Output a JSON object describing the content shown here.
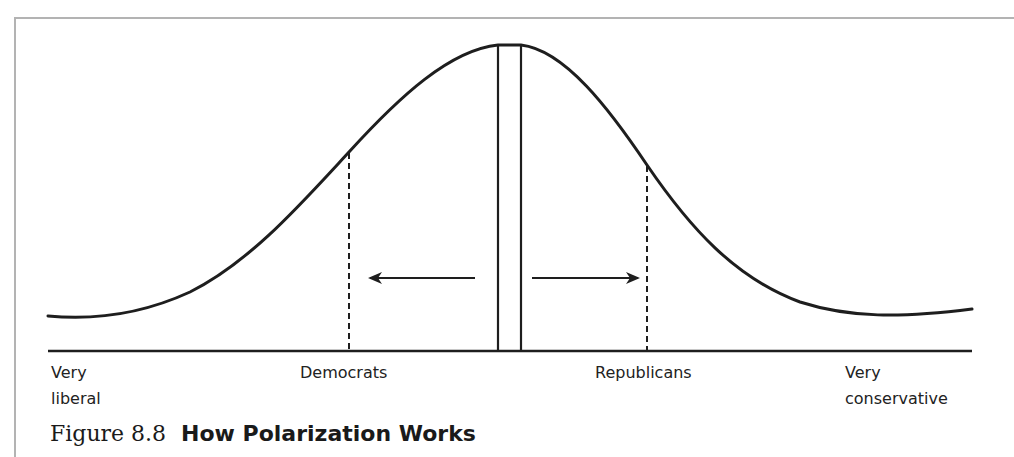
{
  "figure": {
    "number": "Figure 8.8",
    "title": "How Polarization Works"
  },
  "axis": {
    "labels": [
      {
        "id": "very-liberal",
        "text": "Very\nliberal"
      },
      {
        "id": "democrats",
        "text": "Democrats"
      },
      {
        "id": "republicans",
        "text": "Republicans"
      },
      {
        "id": "very-conservative",
        "text": "Very\nconservative"
      }
    ]
  },
  "elements": {
    "distribution_curve": "bell-shaped distribution of voters",
    "center_band": "moderate center",
    "left_arrow": "shift toward liberal",
    "right_arrow": "shift toward conservative",
    "democrats_marker": "dashed line at Democrats position",
    "republicans_marker": "dashed line at Republicans position"
  },
  "colors": {
    "line": "#1e1e1e",
    "frame": "#b3b3b3",
    "background": "#ffffff"
  }
}
